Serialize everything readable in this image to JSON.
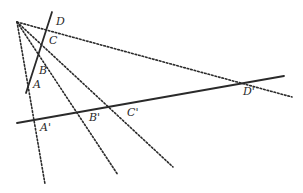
{
  "diagram": {
    "type": "projective-cross-ratio",
    "apex": {
      "x": 17,
      "y": 22
    },
    "colors": {
      "line": "#2a2a2a",
      "background": "#ffffff"
    },
    "lines": {
      "upper_solid": {
        "x1": 26,
        "y1": 93,
        "x2": 52,
        "y2": 12
      },
      "lower_solid": {
        "x1": 17,
        "y1": 123,
        "x2": 284,
        "y2": 76
      }
    },
    "rays": [
      {
        "name": "ray-A",
        "x2": 45,
        "y2": 184
      },
      {
        "name": "ray-B",
        "x2": 118,
        "y2": 175
      },
      {
        "name": "ray-C",
        "x2": 173,
        "y2": 167
      },
      {
        "name": "ray-D",
        "x2": 292,
        "y2": 97
      }
    ],
    "labels": {
      "A": "A",
      "B": "B",
      "C": "C",
      "D": "D",
      "A_prime": "A'",
      "B_prime": "B'",
      "C_prime": "C'",
      "D_prime": "D'"
    }
  }
}
